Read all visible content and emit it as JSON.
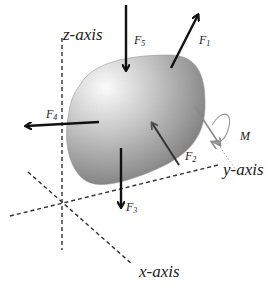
{
  "diagram": {
    "type": "free-body diagram of a rigid body",
    "axes": {
      "z": {
        "label": "z-axis"
      },
      "y": {
        "label": "y-axis"
      },
      "x": {
        "label": "x-axis"
      }
    },
    "forces": [
      {
        "id": "F1",
        "symbol": "F",
        "subscript": "1",
        "direction": "up-right",
        "color": "#111111"
      },
      {
        "id": "F2",
        "symbol": "F",
        "subscript": "2",
        "direction": "up-left (into body)",
        "color": "#444444"
      },
      {
        "id": "F3",
        "symbol": "F",
        "subscript": "3",
        "direction": "down",
        "color": "#111111"
      },
      {
        "id": "F4",
        "symbol": "F",
        "subscript": "4",
        "direction": "left",
        "color": "#111111"
      },
      {
        "id": "F5",
        "symbol": "F",
        "subscript": "5",
        "direction": "down (into body)",
        "color": "#111111"
      }
    ],
    "moment": {
      "id": "M",
      "label": "M",
      "color": "#8a8a8a"
    },
    "body": {
      "shape": "rounded irregular blob",
      "fill_light": "#f2f2f2",
      "fill_dark": "#6e6e6e"
    }
  }
}
